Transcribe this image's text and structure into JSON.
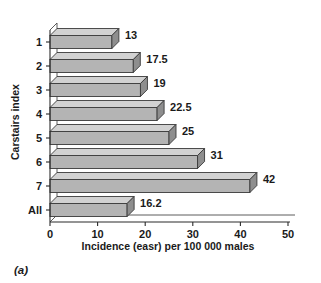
{
  "caption": "(a)",
  "chart_data": {
    "type": "bar",
    "orientation": "horizontal",
    "style": "3d",
    "title": "",
    "xlabel": "Incidence (easr) per 100 000 males",
    "ylabel": "Carstairs index",
    "categories": [
      "1",
      "2",
      "3",
      "4",
      "5",
      "6",
      "7",
      "All"
    ],
    "values": [
      13,
      17.5,
      19,
      22.5,
      25,
      31,
      42,
      16.2
    ],
    "value_labels": [
      "13",
      "17.5",
      "19",
      "22.5",
      "25",
      "31",
      "42",
      "16.2"
    ],
    "xlim": [
      0,
      50
    ],
    "xticks": [
      0,
      10,
      20,
      30,
      40,
      50
    ],
    "xtick_labels": [
      "0",
      "10",
      "20",
      "30",
      "40",
      "50"
    ],
    "grid": false,
    "legend": false,
    "colors": {
      "bar_front": "#b4b4b4",
      "bar_top": "#d2d2d2",
      "bar_side": "#8e8e8e",
      "outline": "#3a3a3a",
      "axis": "#2b2b2b",
      "background": "#ffffff"
    }
  }
}
